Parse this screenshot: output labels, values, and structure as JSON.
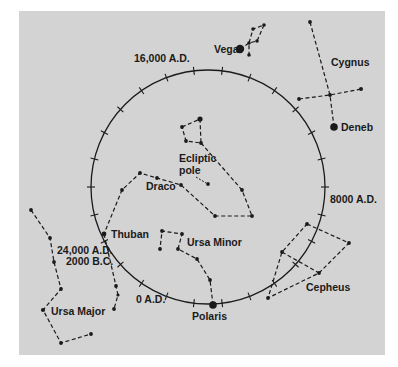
{
  "figure": {
    "panel_color": "#d3d3d3",
    "ink_color": "#1a1a1a"
  },
  "circle": {
    "center": [
      208,
      187
    ],
    "radius": 117,
    "tick_count": 26,
    "date_labels": {
      "top": "16,000 A.D.",
      "right": "8000 A.D.",
      "bottom": "0 A.D.",
      "left_1": "24,000 A.D.",
      "left_2": "2000 B.C."
    }
  },
  "labels": {
    "vega": "Vega",
    "cygnus": "Cygnus",
    "deneb": "Deneb",
    "ecliptic_pole_1": "Ecliptic",
    "ecliptic_pole_2": "pole",
    "draco": "Draco",
    "thuban": "Thuban",
    "ursa_minor": "Ursa Minor",
    "ursa_major": "Ursa Major",
    "polaris": "Polaris",
    "cepheus": "Cepheus"
  },
  "constellations": [
    {
      "name": "Lyra",
      "stars": [
        [
          240,
          49
        ],
        [
          249,
          43
        ],
        [
          253,
          29
        ],
        [
          264,
          25
        ],
        [
          257,
          41
        ],
        [
          249,
          55
        ]
      ]
    },
    {
      "name": "Cygnus",
      "stars": [
        [
          310,
          22
        ],
        [
          330,
          95
        ],
        [
          334,
          127
        ],
        [
          299,
          99
        ],
        [
          361,
          89
        ]
      ]
    },
    {
      "name": "Ursa Minor",
      "stars": [
        [
          213,
          305
        ],
        [
          210,
          280
        ],
        [
          197,
          259
        ],
        [
          178,
          249
        ],
        [
          182,
          234
        ],
        [
          162,
          231
        ],
        [
          160,
          249
        ]
      ]
    },
    {
      "name": "Draco",
      "stars": [
        [
          182,
          127
        ],
        [
          200,
          119
        ],
        [
          201,
          143
        ],
        [
          186,
          141
        ],
        [
          242,
          190
        ],
        [
          252,
          216
        ],
        [
          215,
          216
        ],
        [
          181,
          185
        ],
        [
          157,
          178
        ],
        [
          140,
          173
        ],
        [
          122,
          190
        ],
        [
          104,
          234
        ]
      ]
    },
    {
      "name": "Ursa Major",
      "stars": [
        [
          31,
          210
        ],
        [
          50,
          238
        ],
        [
          54,
          262
        ],
        [
          61,
          289
        ],
        [
          43,
          310
        ],
        [
          61,
          343
        ],
        [
          91,
          334
        ]
      ]
    },
    {
      "name": "Cepheus",
      "stars": [
        [
          307,
          224
        ],
        [
          349,
          243
        ],
        [
          319,
          273
        ],
        [
          282,
          252
        ],
        [
          268,
          298
        ]
      ]
    }
  ]
}
